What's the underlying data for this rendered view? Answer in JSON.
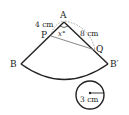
{
  "diagram": {
    "points": {
      "A": "A",
      "B": "B",
      "B_prime": "B′",
      "P": "P",
      "Q": "Q"
    },
    "labels": {
      "AP_length": "4 cm",
      "AQ_length": "8 cm",
      "angle": "x°",
      "radius": "3 cm"
    },
    "colors": {
      "stroke": "#222222",
      "segment_PQ": "#888888",
      "dashed": "#888888"
    }
  }
}
